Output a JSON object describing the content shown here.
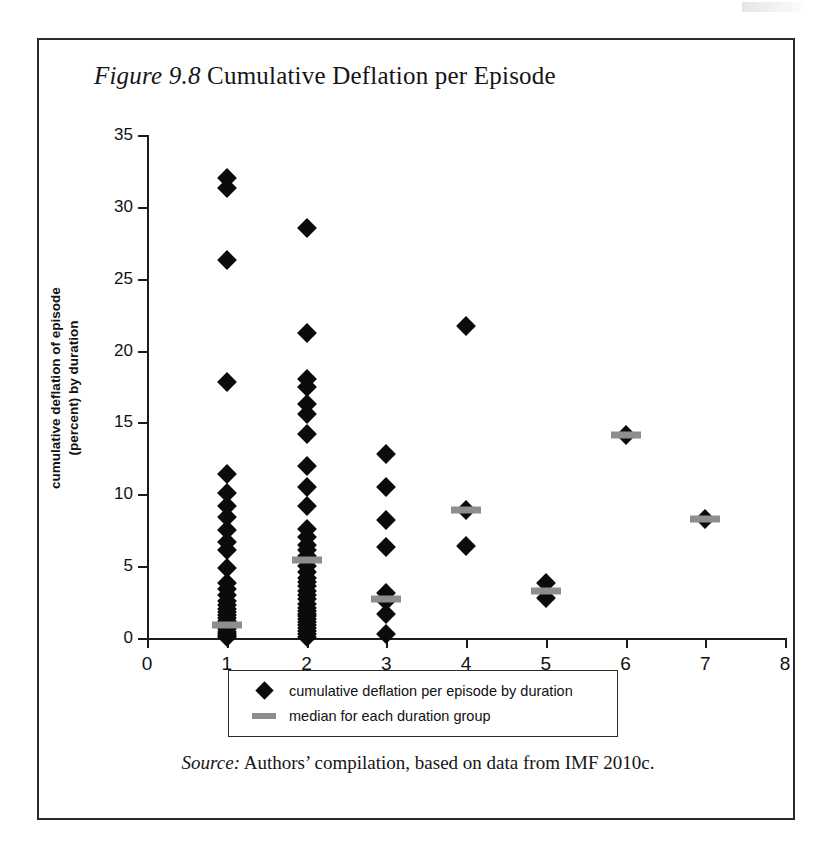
{
  "figure": {
    "number_label": "Figure 9.8",
    "title": "Cumulative Deflation per Episode",
    "source_word": "Source:",
    "source_text": "Authors’ compilation, based on data from IMF 2010c."
  },
  "legend": {
    "items": [
      {
        "icon": "diamond-marker",
        "label": "cumulative deflation per episode by duration",
        "color": "#0b0b0b"
      },
      {
        "icon": "dash-marker",
        "label": "median for each duration group",
        "color": "#8e8e8e"
      }
    ]
  },
  "chart_data": {
    "type": "scatter",
    "title": "Figure 9.8 Cumulative Deflation per Episode",
    "xlabel": "duration of episode in years",
    "ylabel": "cumulative deflation of episode\n(percent) by duration",
    "xlim": [
      0,
      8
    ],
    "ylim": [
      0,
      35
    ],
    "xticks": [
      0,
      1,
      2,
      3,
      4,
      5,
      6,
      7,
      8
    ],
    "yticks": [
      0,
      5,
      10,
      15,
      20,
      25,
      30,
      35
    ],
    "grid": false,
    "legend_position": "bottom",
    "series": [
      {
        "name": "cumulative deflation per episode by duration",
        "marker": "diamond",
        "color": "#0b0b0b",
        "points": [
          {
            "x": 1,
            "y": 32.0
          },
          {
            "x": 1,
            "y": 31.3
          },
          {
            "x": 1,
            "y": 26.3
          },
          {
            "x": 1,
            "y": 17.8
          },
          {
            "x": 1,
            "y": 11.4
          },
          {
            "x": 1,
            "y": 10.1
          },
          {
            "x": 1,
            "y": 9.2
          },
          {
            "x": 1,
            "y": 8.4
          },
          {
            "x": 1,
            "y": 7.5
          },
          {
            "x": 1,
            "y": 6.7
          },
          {
            "x": 1,
            "y": 6.1
          },
          {
            "x": 1,
            "y": 4.9
          },
          {
            "x": 1,
            "y": 3.8
          },
          {
            "x": 1,
            "y": 3.4
          },
          {
            "x": 1,
            "y": 3.0
          },
          {
            "x": 1,
            "y": 2.6
          },
          {
            "x": 1,
            "y": 2.3
          },
          {
            "x": 1,
            "y": 2.0
          },
          {
            "x": 1,
            "y": 1.8
          },
          {
            "x": 1,
            "y": 1.6
          },
          {
            "x": 1,
            "y": 1.4
          },
          {
            "x": 1,
            "y": 1.2
          },
          {
            "x": 1,
            "y": 1.0
          },
          {
            "x": 1,
            "y": 0.9
          },
          {
            "x": 1,
            "y": 0.75
          },
          {
            "x": 1,
            "y": 0.6
          },
          {
            "x": 1,
            "y": 0.45
          },
          {
            "x": 1,
            "y": 0.3
          },
          {
            "x": 1,
            "y": 0.15
          },
          {
            "x": 1,
            "y": 0.05
          },
          {
            "x": 2,
            "y": 28.5
          },
          {
            "x": 2,
            "y": 21.2
          },
          {
            "x": 2,
            "y": 18.0
          },
          {
            "x": 2,
            "y": 17.5
          },
          {
            "x": 2,
            "y": 16.3
          },
          {
            "x": 2,
            "y": 15.6
          },
          {
            "x": 2,
            "y": 14.2
          },
          {
            "x": 2,
            "y": 12.0
          },
          {
            "x": 2,
            "y": 10.5
          },
          {
            "x": 2,
            "y": 9.2
          },
          {
            "x": 2,
            "y": 7.6
          },
          {
            "x": 2,
            "y": 7.0
          },
          {
            "x": 2,
            "y": 6.5
          },
          {
            "x": 2,
            "y": 6.1
          },
          {
            "x": 2,
            "y": 5.7
          },
          {
            "x": 2,
            "y": 5.4
          },
          {
            "x": 2,
            "y": 5.0
          },
          {
            "x": 2,
            "y": 4.6
          },
          {
            "x": 2,
            "y": 4.2
          },
          {
            "x": 2,
            "y": 3.9
          },
          {
            "x": 2,
            "y": 3.6
          },
          {
            "x": 2,
            "y": 3.3
          },
          {
            "x": 2,
            "y": 3.0
          },
          {
            "x": 2,
            "y": 2.7
          },
          {
            "x": 2,
            "y": 2.4
          },
          {
            "x": 2,
            "y": 2.1
          },
          {
            "x": 2,
            "y": 1.9
          },
          {
            "x": 2,
            "y": 1.7
          },
          {
            "x": 2,
            "y": 1.5
          },
          {
            "x": 2,
            "y": 1.3
          },
          {
            "x": 2,
            "y": 1.1
          },
          {
            "x": 2,
            "y": 0.9
          },
          {
            "x": 2,
            "y": 0.7
          },
          {
            "x": 2,
            "y": 0.5
          },
          {
            "x": 2,
            "y": 0.3
          },
          {
            "x": 2,
            "y": 0.1
          },
          {
            "x": 3,
            "y": 12.8
          },
          {
            "x": 3,
            "y": 10.5
          },
          {
            "x": 3,
            "y": 8.2
          },
          {
            "x": 3,
            "y": 6.3
          },
          {
            "x": 3,
            "y": 3.1
          },
          {
            "x": 3,
            "y": 2.6
          },
          {
            "x": 3,
            "y": 1.7
          },
          {
            "x": 3,
            "y": 0.3
          },
          {
            "x": 4,
            "y": 21.7
          },
          {
            "x": 4,
            "y": 8.9
          },
          {
            "x": 4,
            "y": 6.4
          },
          {
            "x": 5,
            "y": 3.8
          },
          {
            "x": 5,
            "y": 2.8
          },
          {
            "x": 6,
            "y": 14.1
          },
          {
            "x": 7,
            "y": 8.3
          }
        ]
      },
      {
        "name": "median for each duration group",
        "marker": "dash",
        "color": "#8e8e8e",
        "points": [
          {
            "x": 1,
            "y": 0.9
          },
          {
            "x": 2,
            "y": 5.4
          },
          {
            "x": 3,
            "y": 2.7
          },
          {
            "x": 4,
            "y": 8.9
          },
          {
            "x": 5,
            "y": 3.3
          },
          {
            "x": 6,
            "y": 14.1
          },
          {
            "x": 7,
            "y": 8.3
          }
        ]
      }
    ]
  }
}
